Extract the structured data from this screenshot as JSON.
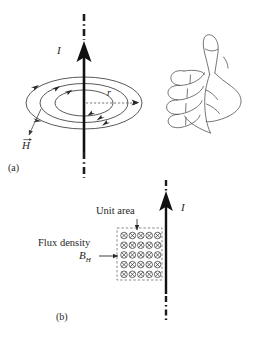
{
  "figure": {
    "title_not_shown": "",
    "background_color": "#ffffff",
    "ink_color": "#262626",
    "panels": [
      {
        "id": "a",
        "caption": "(a)",
        "current_label": "I",
        "radius_label": "r",
        "field_label": "H",
        "field_label_has_vector_arrow": true,
        "hand": "right-hand-thumbs-up",
        "field_line_count": 3
      },
      {
        "id": "b",
        "caption": "(b)",
        "current_label": "I",
        "unit_area_label": "Unit area",
        "flux_density_label": "Flux density",
        "flux_density_symbol": "B",
        "flux_density_subscript": "H",
        "grid_rows": 5,
        "grid_cols": 5,
        "grid_symbol": "cross-in-circle"
      }
    ]
  }
}
